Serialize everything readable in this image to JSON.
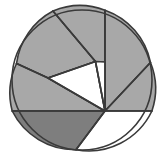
{
  "figure": {
    "type": "geometric-partition-diagram",
    "background_color": "#ffffff",
    "canvas": {
      "width": 162,
      "height": 162
    }
  },
  "palette": {
    "outline": "#3a3a3a",
    "light_gray": "#a8a8a8",
    "dark_gray": "#7e7e7e",
    "white": "#ffffff",
    "stroke_width": 1.6
  },
  "circle": {
    "label": "outer-circle",
    "center_x": 82,
    "center_y": 80,
    "radius": 70,
    "fill": "#ffffff",
    "stroke": "#3a3a3a"
  },
  "vertex": {
    "label": "convergence-point",
    "x": 105,
    "y": 111
  },
  "regions": [
    {
      "id": "region-top-left",
      "label": "top-left-sector",
      "shade": "light",
      "fill": "#a8a8a8",
      "path": "M 53 11 A 70 70 0 0 0 16.5 63.5 L 48 78 L 95.5 61.5 Z"
    },
    {
      "id": "region-top-center",
      "label": "top-center-sector",
      "shade": "light",
      "fill": "#a8a8a8",
      "path": "M 53 11 L 95.5 61.5 L 105 62 L 105 10.2 A 70 70 0 0 0 53 11 Z"
    },
    {
      "id": "region-top-right",
      "label": "top-right-sector",
      "shade": "light",
      "fill": "#a8a8a8",
      "path": "M 105 10.2 A 70 70 0 0 1 150.5 62.5 L 105 111 L 105 62 Z"
    },
    {
      "id": "region-right",
      "label": "right-sector",
      "shade": "light",
      "fill": "#a8a8a8",
      "path": "M 150.5 62.5 A 70 70 0 0 1 151.9 111 L 105 111 Z"
    },
    {
      "id": "region-left-upper",
      "label": "left-upper-sector",
      "shade": "light",
      "fill": "#a8a8a8",
      "path": "M 16.5 63.5 A 70 70 0 0 0 12.2 111 L 105 111 L 48 78 Z"
    },
    {
      "id": "region-white-triangle",
      "label": "white-triangle-region",
      "shade": "white",
      "fill": "#ffffff",
      "path": "M 48 78 L 95.5 61.5 L 105 111 Z"
    },
    {
      "id": "region-white-sliver",
      "label": "white-sliver-region",
      "shade": "white",
      "fill": "#ffffff",
      "path": "M 95.5 61.5 L 105 62 L 105 111 Z"
    },
    {
      "id": "region-bottom-left",
      "label": "bottom-left-sector",
      "shade": "dark",
      "fill": "#7e7e7e",
      "path": "M 12.2 111 A 70 70 0 0 0 76 149.7 L 105 111 Z"
    },
    {
      "id": "region-bottom-right",
      "label": "bottom-right-sector",
      "shade": "white",
      "fill": "#ffffff",
      "path": "M 76 149.7 A 70 70 0 0 0 151.9 111 L 105 111 Z"
    }
  ],
  "dividing_lines": [
    {
      "id": "line-top-vertical",
      "label": "vertical-divider-top",
      "x1": 105,
      "y1": 10.2,
      "x2": 105,
      "y2": 111
    },
    {
      "id": "line-upper-left",
      "label": "upper-left-divider",
      "x1": 53,
      "y1": 11,
      "x2": 95.5,
      "y2": 61.5
    },
    {
      "id": "line-fan-a",
      "label": "fan-line-to-left-arc",
      "x1": 16.5,
      "y1": 63.5,
      "x2": 48,
      "y2": 78
    },
    {
      "id": "line-fan-b",
      "label": "fan-line-left-diagonal",
      "x1": 48,
      "y1": 78,
      "x2": 105,
      "y2": 111
    },
    {
      "id": "line-fan-c",
      "label": "fan-line-triangle-upper",
      "x1": 48,
      "y1": 78,
      "x2": 95.5,
      "y2": 61.5
    },
    {
      "id": "line-fan-d",
      "label": "fan-line-triangle-right",
      "x1": 95.5,
      "y1": 61.5,
      "x2": 105,
      "y2": 111
    },
    {
      "id": "line-horizontal",
      "label": "horizontal-divider-left",
      "x1": 12.2,
      "y1": 111,
      "x2": 105,
      "y2": 111
    },
    {
      "id": "line-horizontal-r",
      "label": "horizontal-divider-right",
      "x1": 105,
      "y1": 111,
      "x2": 151.9,
      "y2": 111
    },
    {
      "id": "line-right-upper",
      "label": "right-upper-divider",
      "x1": 150.5,
      "y1": 62.5,
      "x2": 105,
      "y2": 111
    },
    {
      "id": "line-bottom",
      "label": "bottom-divider",
      "x1": 76,
      "y1": 149.7,
      "x2": 105,
      "y2": 111
    }
  ]
}
